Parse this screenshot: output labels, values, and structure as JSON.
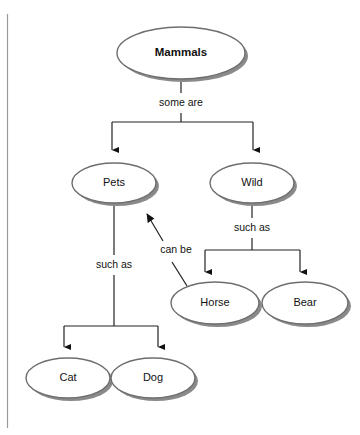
{
  "diagram": {
    "type": "concept-map",
    "colors": {
      "node_fill": "#ffffff",
      "node_stroke": "#6e6e6e",
      "node_shadow": "#8a8a8a",
      "connector": "#222222",
      "text": "#111111",
      "page_rule": "#9a9a9a",
      "background": "#ffffff"
    },
    "nodes": [
      {
        "id": "mammals",
        "label": "Mammals",
        "bold": true,
        "cx": 181,
        "cy": 53,
        "rx": 64,
        "ry": 26
      },
      {
        "id": "pets",
        "label": "Pets",
        "bold": false,
        "cx": 114,
        "cy": 183,
        "rx": 42,
        "ry": 20
      },
      {
        "id": "wild",
        "label": "Wild",
        "bold": false,
        "cx": 252,
        "cy": 183,
        "rx": 42,
        "ry": 20
      },
      {
        "id": "horse",
        "label": "Horse",
        "bold": false,
        "cx": 215,
        "cy": 303,
        "rx": 44,
        "ry": 21
      },
      {
        "id": "bear",
        "label": "Bear",
        "bold": false,
        "cx": 305,
        "cy": 303,
        "rx": 43,
        "ry": 21
      },
      {
        "id": "cat",
        "label": "Cat",
        "bold": false,
        "cx": 68,
        "cy": 378,
        "rx": 42,
        "ry": 20
      },
      {
        "id": "dog",
        "label": "Dog",
        "bold": false,
        "cx": 153,
        "cy": 378,
        "rx": 42,
        "ry": 20
      }
    ],
    "edges": [
      {
        "id": "mammals-to-children",
        "label": "some are",
        "from": "mammals",
        "to": [
          "pets",
          "wild"
        ],
        "label_x": 181,
        "label_y": 103
      },
      {
        "id": "wild-to-children",
        "label": "such as",
        "from": "wild",
        "to": [
          "horse",
          "bear"
        ],
        "label_x": 252,
        "label_y": 228
      },
      {
        "id": "pets-to-children",
        "label": "such as",
        "from": "pets",
        "to": [
          "cat",
          "dog"
        ],
        "label_x": 114,
        "label_y": 265
      },
      {
        "id": "horse-to-pets",
        "label": "can be",
        "from": "horse",
        "to": [
          "pets"
        ],
        "label_x": 176,
        "label_y": 250
      }
    ]
  }
}
